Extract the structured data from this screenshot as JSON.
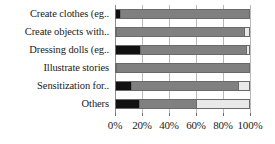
{
  "chart_data": {
    "type": "bar",
    "orientation": "horizontal",
    "stacked": true,
    "stack_normalized_percent": true,
    "title": "",
    "subtitle": "",
    "xlabel": "",
    "ylabel": "",
    "xlim": [
      0,
      100
    ],
    "xtick_labels": [
      "0%",
      "20%",
      "40%",
      "60%",
      "80%",
      "100%"
    ],
    "xtick_values": [
      0,
      20,
      40,
      60,
      80,
      100
    ],
    "grid": true,
    "grid_axis": "x",
    "legend": false,
    "legend_position": "none",
    "categories": [
      "Create clothes (eg..",
      "Create  objects with..",
      "Dressing dolls (eg..",
      "Illustrate stories",
      "Sensitization for..",
      "Others"
    ],
    "series": [
      {
        "name": "series-1",
        "color": "#111111",
        "values": [
          3,
          0,
          18,
          0,
          11,
          17
        ]
      },
      {
        "name": "series-2",
        "color": "#808080",
        "values": [
          97,
          96,
          80,
          100,
          81,
          43
        ]
      },
      {
        "name": "series-3",
        "color": "#e9e9e9",
        "values": [
          0,
          4,
          2,
          0,
          8,
          40
        ]
      }
    ]
  },
  "style": {
    "plot_background": "#ffffff",
    "gridline_color": "#b9b9b9",
    "bar_border_color": "#6a6a6a",
    "text_color": "#1a1a1a"
  }
}
